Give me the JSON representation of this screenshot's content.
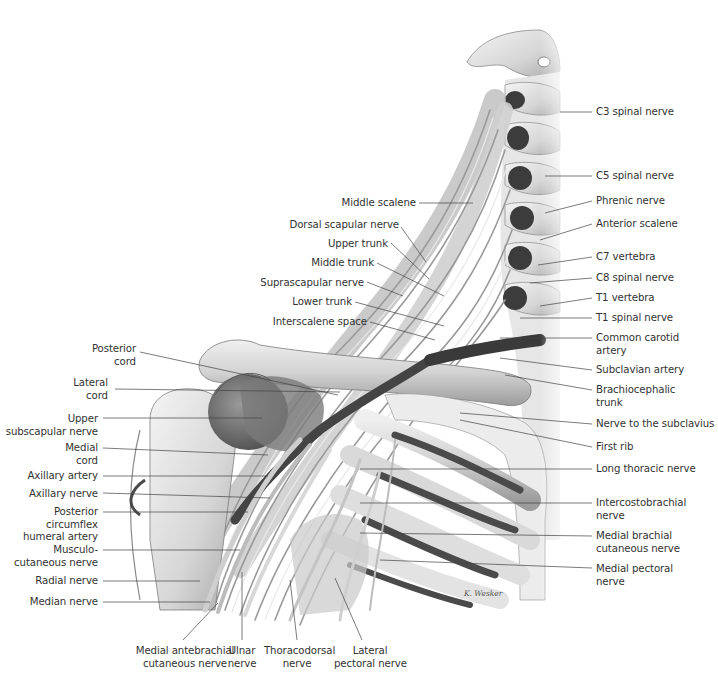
{
  "figure": {
    "signature": "K. Wesker"
  },
  "labels_left": [
    {
      "id": "middle-scalene",
      "text": "Middle scalene"
    },
    {
      "id": "dorsal-scapular-nerve",
      "text": "Dorsal scapular nerve"
    },
    {
      "id": "upper-trunk",
      "text": "Upper trunk"
    },
    {
      "id": "middle-trunk",
      "text": "Middle trunk"
    },
    {
      "id": "suprascapular-nerve",
      "text": "Suprascapular nerve"
    },
    {
      "id": "lower-trunk",
      "text": "Lower trunk"
    },
    {
      "id": "interscalene-space",
      "text": "Interscalene space"
    },
    {
      "id": "posterior-cord",
      "line1": "Posterior",
      "line2": "cord"
    },
    {
      "id": "lateral-cord",
      "line1": "Lateral",
      "line2": "cord"
    },
    {
      "id": "upper-subscapular-nerve",
      "line1": "Upper",
      "line2": "subscapular nerve"
    },
    {
      "id": "medial-cord",
      "line1": "Medial",
      "line2": "cord"
    },
    {
      "id": "axillary-artery",
      "text": "Axillary artery"
    },
    {
      "id": "axillary-nerve",
      "text": "Axillary nerve"
    },
    {
      "id": "posterior-circumflex-humeral-artery",
      "line1": "Posterior",
      "line2": "circumflex",
      "line3": "humeral artery"
    },
    {
      "id": "musculocutaneous-nerve",
      "line1": "Musculo-",
      "line2": "cutaneous nerve"
    },
    {
      "id": "radial-nerve",
      "text": "Radial nerve"
    },
    {
      "id": "median-nerve",
      "text": "Median nerve"
    }
  ],
  "labels_right": [
    {
      "id": "c3-spinal-nerve",
      "text": "C3 spinal nerve"
    },
    {
      "id": "c5-spinal-nerve",
      "text": "C5 spinal nerve"
    },
    {
      "id": "phrenic-nerve",
      "text": "Phrenic nerve"
    },
    {
      "id": "anterior-scalene",
      "text": "Anterior scalene"
    },
    {
      "id": "c7-vertebra",
      "text": "C7 vertebra"
    },
    {
      "id": "c8-spinal-nerve",
      "text": "C8 spinal nerve"
    },
    {
      "id": "t1-vertebra",
      "text": "T1 vertebra"
    },
    {
      "id": "t1-spinal-nerve",
      "text": "T1 spinal nerve"
    },
    {
      "id": "common-carotid-artery",
      "line1": "Common carotid",
      "line2": "artery"
    },
    {
      "id": "subclavian-artery",
      "text": "Subclavian artery"
    },
    {
      "id": "brachiocephalic-trunk",
      "line1": "Brachiocephalic",
      "line2": "trunk"
    },
    {
      "id": "nerve-to-subclavius",
      "text": "Nerve to the subclavius"
    },
    {
      "id": "first-rib",
      "text": "First rib"
    },
    {
      "id": "long-thoracic-nerve",
      "text": "Long thoracic nerve"
    },
    {
      "id": "intercostobrachial-nerve",
      "line1": "Intercostobrachial",
      "line2": "nerve"
    },
    {
      "id": "medial-brachial-cutaneous-nerve",
      "line1": "Medial brachial",
      "line2": "cutaneous nerve"
    },
    {
      "id": "medial-pectoral-nerve",
      "line1": "Medial pectoral",
      "line2": "nerve"
    }
  ],
  "labels_bottom": [
    {
      "id": "medial-antebrachial-cutaneous-nerve",
      "line1": "Medial antebrachial",
      "line2": "cutaneous nerve"
    },
    {
      "id": "ulnar-nerve",
      "line1": "Ulnar",
      "line2": "nerve"
    },
    {
      "id": "thoracodorsal-nerve",
      "line1": "Thoracodorsal",
      "line2": "nerve"
    },
    {
      "id": "lateral-pectoral-nerve",
      "line1": "Lateral",
      "line2": "pectoral nerve"
    }
  ]
}
